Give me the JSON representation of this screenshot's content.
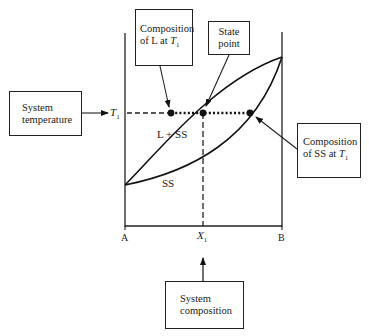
{
  "diagram": {
    "type": "binary isomorphous phase diagram with annotations",
    "axis": {
      "left_label": "A",
      "right_label": "B",
      "x_marker": "X",
      "x_marker_sub": "1",
      "temp_marker": "T",
      "temp_marker_sub": "1"
    },
    "regions": {
      "liquid": "L",
      "two_phase": "L + SS",
      "solid": "SS"
    },
    "callouts": {
      "comp_L": {
        "line1": "Composition",
        "line2_prefix": "of L at ",
        "line2_var": "T",
        "line2_sub": "1"
      },
      "state_point": {
        "line1": "State",
        "line2": "point"
      },
      "system_temperature": {
        "line1": "System",
        "line2": "temperature"
      },
      "comp_SS": {
        "line1": "Composition",
        "line2_prefix": "of SS at ",
        "line2_var": "T",
        "line2_sub": "1"
      },
      "system_composition": {
        "line1": "System",
        "line2": "composition"
      }
    },
    "colors": {
      "ink": "#1a1a1a",
      "background": "#ffffff"
    }
  }
}
